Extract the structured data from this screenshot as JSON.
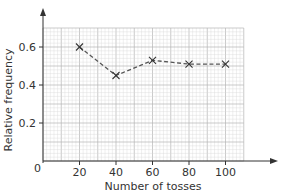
{
  "chart_data": {
    "type": "line",
    "title": "",
    "xlabel": "Number of tosses",
    "ylabel": "Relative frequency",
    "x": [
      20,
      40,
      60,
      80,
      100
    ],
    "series": [
      {
        "name": "Relative frequency",
        "values": [
          0.6,
          0.45,
          0.53,
          0.51,
          0.51
        ],
        "style": "dashed",
        "marker": "x"
      }
    ],
    "xticks": [
      20,
      40,
      60,
      80,
      100
    ],
    "yticks": [
      0.2,
      0.4,
      0.6
    ],
    "xtick_labels": [
      "20",
      "40",
      "60",
      "80",
      "100"
    ],
    "ytick_labels": [
      "0.2",
      "0.4",
      "0.6"
    ],
    "origin_label": "0",
    "xlim": [
      0,
      110
    ],
    "ylim": [
      0,
      0.7
    ],
    "grid": true,
    "legend": "none"
  },
  "colors": {
    "grid_minor": "#d8d8d8",
    "grid_major": "#b4b4b4",
    "axis": "#333333",
    "line": "#555555"
  }
}
